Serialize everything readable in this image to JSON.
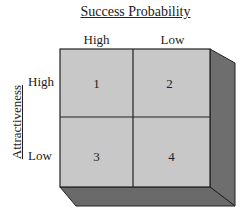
{
  "diagram": {
    "title": "Success Probability",
    "y_axis_label": "Attractiveness",
    "columns": [
      {
        "label": "High"
      },
      {
        "label": "Low"
      }
    ],
    "rows": [
      {
        "label": "High"
      },
      {
        "label": "Low"
      }
    ],
    "cells": [
      {
        "label": "1"
      },
      {
        "label": "2"
      },
      {
        "label": "3"
      },
      {
        "label": "4"
      }
    ],
    "colors": {
      "front_face": "#c8c8c8",
      "side_face": "#6e6e6e",
      "bottom_face": "#6a6a6a",
      "lines": "#222222"
    }
  }
}
